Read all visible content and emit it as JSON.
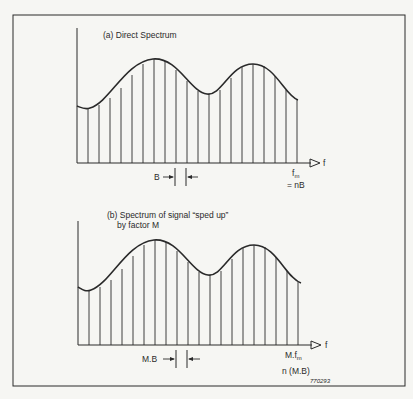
{
  "figure_id": "770293",
  "panels": [
    {
      "id": "a",
      "title": "(a) Direct Spectrum",
      "axis_label": "f",
      "spacing_label": "B",
      "end_label_main": "f",
      "end_label_sub": "m",
      "end_label_eq": "= nB"
    },
    {
      "id": "b",
      "title_line1": "(b) Spectrum of signal “sped up”",
      "title_line2": "by factor M",
      "axis_label": "f",
      "spacing_label": "M.B",
      "end_label_main": "M.f",
      "end_label_sub": "m",
      "end_label_eq": "n (M.B)"
    }
  ],
  "colors": {
    "ink": "#2a2a2a",
    "paper": "#f6f6f3"
  }
}
